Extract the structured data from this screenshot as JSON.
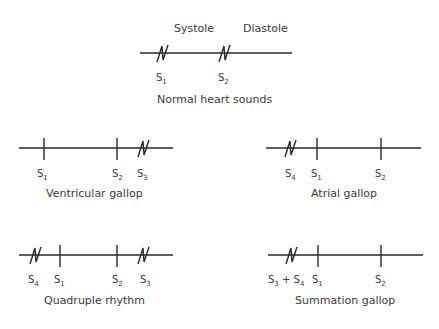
{
  "normal": {
    "title": "Normal heart sounds",
    "phase_labels": {
      "systole": "Systole",
      "diastole": "Diastole"
    },
    "line": {
      "x1": 140,
      "x2": 292,
      "y": 53
    },
    "sounds": [
      {
        "name": "S",
        "sub": "1",
        "type": "zigzag",
        "x": 162
      },
      {
        "name": "S",
        "sub": "2",
        "type": "zigzag",
        "x": 224
      }
    ]
  },
  "ventricular_gallop": {
    "title": "Ventricular gallop",
    "line": {
      "x1": 19,
      "x2": 173,
      "y": 148
    },
    "sounds": [
      {
        "name": "S",
        "sub": "1",
        "type": "tick",
        "x": 44
      },
      {
        "name": "S",
        "sub": "2",
        "type": "tick",
        "x": 117
      },
      {
        "name": "S",
        "sub": "3",
        "type": "zigzag",
        "x": 143
      }
    ]
  },
  "atrial_gallop": {
    "title": "Atrial gallop",
    "line": {
      "x1": 266,
      "x2": 421,
      "y": 148
    },
    "sounds": [
      {
        "name": "S",
        "sub": "4",
        "type": "zigzag",
        "x": 290
      },
      {
        "name": "S",
        "sub": "1",
        "type": "tick",
        "x": 317
      },
      {
        "name": "S",
        "sub": "2",
        "type": "tick",
        "x": 381
      }
    ]
  },
  "quadruple_rhythm": {
    "title": "Quadruple rhythm",
    "line": {
      "x1": 19,
      "x2": 173,
      "y": 255
    },
    "sounds": [
      {
        "name": "S",
        "sub": "4",
        "type": "zigzag",
        "x": 35
      },
      {
        "name": "S",
        "sub": "1",
        "type": "tick",
        "x": 60
      },
      {
        "name": "S",
        "sub": "2",
        "type": "tick",
        "x": 117
      },
      {
        "name": "S",
        "sub": "3",
        "type": "zigzag",
        "x": 143
      }
    ]
  },
  "summation_gallop": {
    "title": "Summation gallop",
    "line": {
      "x1": 268,
      "x2": 423,
      "y": 255
    },
    "sounds": [
      {
        "name": "S",
        "sub": "3",
        "extra": " + S",
        "extra_sub": "4",
        "type": "zigzag",
        "x": 291
      },
      {
        "name": "S",
        "sub": "1",
        "type": "tick",
        "x": 318
      },
      {
        "name": "S",
        "sub": "2",
        "type": "tick",
        "x": 381
      }
    ]
  }
}
